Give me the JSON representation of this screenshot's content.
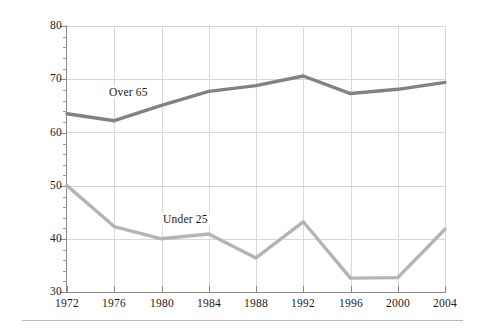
{
  "chart_data": {
    "type": "line",
    "title": "",
    "subtitle": "",
    "xlabel": "",
    "ylabel": "Percent Voting",
    "x": [
      1972,
      1976,
      1980,
      1984,
      1988,
      1992,
      1996,
      2000,
      2004
    ],
    "categories": [
      "1972",
      "1976",
      "1980",
      "1984",
      "1988",
      "1992",
      "1996",
      "2000",
      "2004"
    ],
    "xlim": [
      1972,
      2004
    ],
    "ylim": [
      30,
      80
    ],
    "yticks": [
      30,
      40,
      50,
      60,
      70,
      80
    ],
    "ytick_labels": [
      "30",
      "40",
      "50",
      "60",
      "70",
      "80"
    ],
    "y_minor_tick_step": 2,
    "grid": "both",
    "legend": "inline-annotations",
    "series": [
      {
        "name": "Over 65",
        "color": "#828282",
        "label_text": "Over 65",
        "values": [
          63.5,
          62.2,
          65.1,
          67.7,
          68.8,
          70.6,
          67.3,
          68.1,
          69.4
        ]
      },
      {
        "name": "Under 25",
        "color": "#b4b4b4",
        "label_text": "Under 25",
        "values": [
          50.0,
          42.3,
          40.0,
          40.9,
          36.4,
          43.2,
          32.6,
          32.7,
          41.8
        ]
      }
    ],
    "annotations": [
      {
        "text": "Over 65",
        "near_x": 1976,
        "near_y": 66.5
      },
      {
        "text": "Under 25",
        "near_x": 1982,
        "near_y": 43.5
      }
    ]
  },
  "axis": {
    "y_title": "Percent Voting",
    "y_tick_labels": [
      "80",
      "70",
      "60",
      "50",
      "40",
      "30"
    ],
    "x_tick_labels": [
      "1972",
      "1976",
      "1980",
      "1984",
      "1988",
      "1992",
      "1996",
      "2000",
      "2004"
    ]
  },
  "labels": {
    "over65": "Over 65",
    "under25": "Under 25"
  },
  "colors": {
    "over65_line": "#828282",
    "under25_line": "#b4b4b4",
    "gridline": "#d8d8d8",
    "axis": "#8a8a8a",
    "text": "#1b1b1b",
    "background": "#ffffff"
  }
}
